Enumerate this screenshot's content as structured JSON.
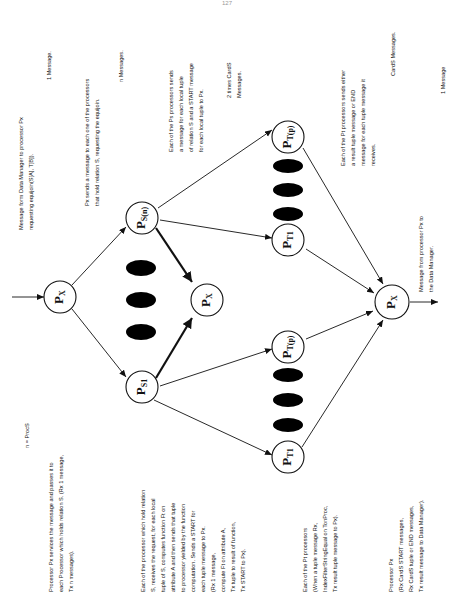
{
  "page": {
    "page_number": "127"
  },
  "nodes": {
    "px_start": {
      "base": "P",
      "sub": "X"
    },
    "ps_n": {
      "base": "P",
      "sub": "S(n)"
    },
    "ps_1": {
      "base": "P",
      "sub": "S1"
    },
    "px_mid": {
      "base": "P",
      "sub": "X"
    },
    "pt_p_top": {
      "base": "P",
      "sub": "T(p)"
    },
    "pt_1_top": {
      "base": "P",
      "sub": "T1"
    },
    "pt_p_bottom": {
      "base": "P",
      "sub": "T(p)"
    },
    "pt_1_bottom": {
      "base": "P",
      "sub": "T1"
    },
    "px_end": {
      "base": "P",
      "sub": "X"
    }
  },
  "annotations": {
    "n_def": [
      "n = ProcS"
    ],
    "px_services": [
      "Processor Px services the message and passes it to",
      "each Processor which holds relation S. (Rx 1 message,",
      "Tx n messages)."
    ],
    "ps_each": [
      "Each of the processor which hold relation",
      "S, receives the request, for each local",
      "tuple of S, computes function Ft on",
      "attribute A and then sends that tuple",
      "to processor yielded by the function",
      "computation.  Sends a START for",
      "each tuple message to Px.",
      "(Rx 1 message,",
      "compute Ft on attribute A,",
      "Tx tuple to result of function,",
      "Tx START to Px)."
    ],
    "pt_each_bottom": [
      "Each of the Pt processors",
      "(When a tuple message Rx,",
      "IndexFilterStringEqual  on  TonProc,",
      "Tx result tuple message to Px)."
    ],
    "px_final": [
      "Processor Px",
      "(Rx CardS START messages,",
      "Rx CardS tuple or END messages,",
      "Tx result message to Data Manager)."
    ],
    "dm_request": [
      "Message form Data Manager to processor Px",
      "requesting   equijoin(S[A],    T[B])."
    ],
    "one_message_top": [
      "1  Message."
    ],
    "px_sends": [
      "Px sends a message to each one of the processors",
      "that hold relation S, requesting the equijoin."
    ],
    "n_messages": [
      "n  Messages."
    ],
    "ps_sends": [
      "Each of the Ps processors sends",
      "a message for each local tuple",
      "of relation S and a START message",
      "for each local tuple to Px."
    ],
    "two_times_cards": [
      "2 times CardS",
      "Messages."
    ],
    "pt_sends": [
      "Each of the Pt processors sends either",
      "a result tuple message or END",
      "message for each tuple message it",
      "receives."
    ],
    "cards_messages": [
      "CardS  Messages."
    ],
    "px_to_dm": [
      "Message from processor Px to",
      "the Data Manager."
    ],
    "one_message_end": [
      "1  Message"
    ]
  }
}
